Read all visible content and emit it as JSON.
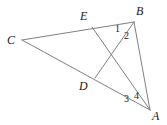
{
  "figure": {
    "type": "geometry-diagram",
    "width": 167,
    "height": 125,
    "background_color": "#ffffff",
    "line_color": "#808080",
    "line_width": 1,
    "label_color": "#1a1a1a",
    "points": {
      "C": {
        "x": 22,
        "y": 40,
        "label": "C",
        "label_x": 7,
        "label_y": 34
      },
      "B": {
        "x": 134,
        "y": 22,
        "label": "B",
        "label_x": 136,
        "label_y": 5
      },
      "A": {
        "x": 150,
        "y": 110,
        "label": "A",
        "label_x": 152,
        "label_y": 110
      },
      "E": {
        "x": 92,
        "y": 27,
        "label": "E",
        "label_x": 80,
        "label_y": 10
      },
      "D": {
        "x": 95,
        "y": 78,
        "label": "D",
        "label_x": 79,
        "label_y": 80
      }
    },
    "segments": [
      {
        "name": "CB",
        "from": "C",
        "to": "B"
      },
      {
        "name": "CA",
        "from": "C",
        "to": "A"
      },
      {
        "name": "BA",
        "from": "B",
        "to": "A"
      },
      {
        "name": "EA",
        "from": "E",
        "to": "A"
      },
      {
        "name": "BD",
        "from": "B",
        "to": "D"
      }
    ],
    "angle_labels": [
      {
        "name": "angle-1",
        "text": "1",
        "x": 115,
        "y": 24
      },
      {
        "name": "angle-2",
        "text": "2",
        "x": 124,
        "y": 31
      },
      {
        "name": "angle-3",
        "text": "3",
        "x": 124,
        "y": 94
      },
      {
        "name": "angle-4",
        "text": "4",
        "x": 134,
        "y": 91
      }
    ]
  }
}
